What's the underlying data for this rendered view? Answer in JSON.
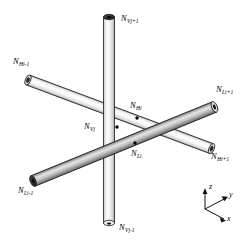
{
  "figure": {
    "background_color": "#ffffff",
    "rods": [
      {
        "id": "vertical-rod",
        "family": "V",
        "shade": "light",
        "orientation": "vertical"
      },
      {
        "id": "upper-diagonal-rod",
        "family": "H",
        "shade": "light",
        "orientation": "diagonal-down-right"
      },
      {
        "id": "lower-diagonal-rod",
        "family": "L",
        "shade": "dark",
        "orientation": "diagonal-up-right"
      }
    ]
  },
  "labels": {
    "v_top": {
      "base": "N",
      "sub": "Vj+1"
    },
    "v_mid": {
      "base": "N",
      "sub": "Vj"
    },
    "v_bottom": {
      "base": "N",
      "sub": "Vj-1"
    },
    "h_left": {
      "base": "N",
      "sub": "Hi-1"
    },
    "h_mid": {
      "base": "N",
      "sub": "Hi"
    },
    "h_right": {
      "base": "N",
      "sub": "Hi+1"
    },
    "l_left": {
      "base": "N",
      "sub": "Li-1"
    },
    "l_mid": {
      "base": "N",
      "sub": "Li"
    },
    "l_right": {
      "base": "N",
      "sub": "Li+1"
    }
  },
  "axes": {
    "z": "z",
    "y": "y",
    "x": "x"
  },
  "colors": {
    "outline": "#1a1a1a",
    "rod_light_high": "#fdfdfd",
    "rod_light_low": "#c9c9c9",
    "rod_dark_high": "#e2e2e2",
    "rod_dark_low": "#7d7d7d",
    "cap_dark": "#2b2b2b",
    "node_dot": "#000000"
  }
}
